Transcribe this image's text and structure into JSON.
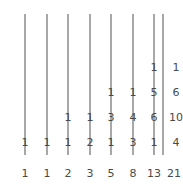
{
  "figure": {
    "type": "fibonacci-pascal-diagonals",
    "line_color": "#a8a8a8",
    "text_color": "#4a4a4a",
    "background": "#ffffff",
    "columns": [
      {
        "index": 0,
        "sum_label": "1",
        "entries": [
          "1"
        ]
      },
      {
        "index": 1,
        "sum_label": "1",
        "entries": [
          "1"
        ]
      },
      {
        "index": 2,
        "sum_label": "2",
        "entries": [
          "1",
          "1"
        ]
      },
      {
        "index": 3,
        "sum_label": "3",
        "entries": [
          "2",
          "1"
        ]
      },
      {
        "index": 4,
        "sum_label": "5",
        "entries": [
          "1",
          "3",
          "1"
        ]
      },
      {
        "index": 5,
        "sum_label": "8",
        "entries": [
          "3",
          "4",
          "1"
        ]
      },
      {
        "index": 6,
        "sum_label": "13",
        "entries": [
          "1",
          "6",
          "5",
          "1"
        ]
      },
      {
        "index": 7,
        "sum_label": "21",
        "entries": [
          "4",
          "10",
          "6",
          "1"
        ]
      }
    ]
  }
}
